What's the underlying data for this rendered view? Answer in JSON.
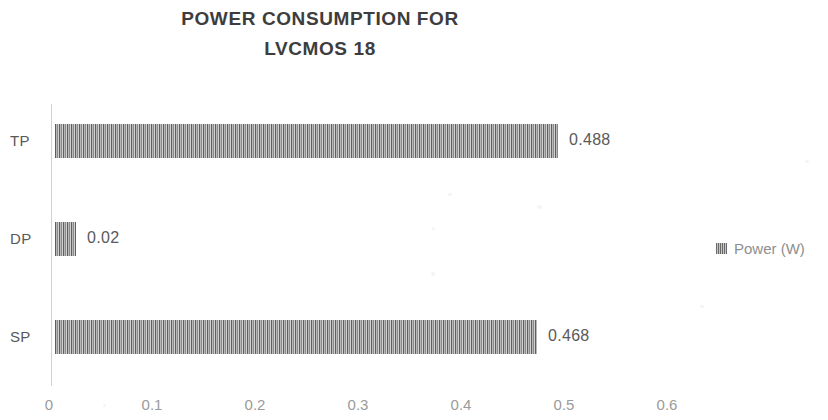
{
  "chart_data": {
    "type": "bar",
    "orientation": "horizontal",
    "title": "POWER CONSUMPTION FOR LVCMOS 18",
    "title_lines": [
      "POWER CONSUMPTION FOR",
      "LVCMOS 18"
    ],
    "categories": [
      "TP",
      "DP",
      "SP"
    ],
    "values": [
      0.488,
      0.02,
      0.468
    ],
    "data_labels": [
      "0.488",
      "0.02",
      "0.468"
    ],
    "series": [
      {
        "name": "Power (W)",
        "values": [
          0.488,
          0.02,
          0.468
        ]
      }
    ],
    "xlabel": "",
    "ylabel": "",
    "xlim": [
      0,
      0.65
    ],
    "xticks": [
      0,
      0.1,
      0.2,
      0.3,
      0.4,
      0.5,
      0.6
    ],
    "xtick_labels": [
      "0",
      "0.1",
      "0.2",
      "0.3",
      "0.4",
      "0.5",
      "0.6"
    ],
    "grid": false,
    "legend": {
      "position": "right",
      "entries": [
        "Power (W)"
      ]
    },
    "colors": {
      "bar_fill": "#8c8c8c",
      "bar_pattern": "vertical-stripes",
      "axis": "#d2d2d2",
      "text": "#595959",
      "background": "#ffffff"
    }
  },
  "legend": {
    "label": "Power (W)"
  },
  "axis": {
    "ticks": [
      "0",
      "0.1",
      "0.2",
      "0.3",
      "0.4",
      "0.5",
      "0.6"
    ]
  }
}
